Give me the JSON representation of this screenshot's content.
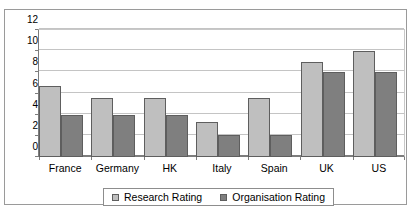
{
  "chart_data": {
    "type": "bar",
    "title": "",
    "subtitle": "",
    "xlabel": "",
    "ylabel": "",
    "categories": [
      "France",
      "Germany",
      "HK",
      "Italy",
      "Spain",
      "UK",
      "US"
    ],
    "series": [
      {
        "name": "Research Rating",
        "color": "#bfbfbf",
        "values": [
          6.7,
          5.6,
          5.6,
          3.3,
          5.6,
          9.0,
          10.0
        ]
      },
      {
        "name": "Organisation Rating",
        "color": "#7f7f7f",
        "values": [
          4.0,
          4.0,
          4.0,
          2.1,
          2.1,
          8.0,
          8.0
        ]
      }
    ],
    "ylim": [
      0,
      12
    ],
    "yticks": [
      0,
      2,
      4,
      6,
      8,
      10,
      12
    ],
    "ytick_labels": [
      "0",
      "2",
      "4",
      "6",
      "8",
      "10",
      "12"
    ],
    "grid": true,
    "grid_axis": "y",
    "legend_position": "bottom",
    "legend_entries": [
      "Research Rating",
      "Organisation Rating"
    ]
  },
  "legend": {
    "entries": [
      {
        "label": "Research Rating",
        "swatch": "series0"
      },
      {
        "label": "Organisation Rating",
        "swatch": "series1"
      }
    ]
  },
  "artifact": {
    "top_text": ""
  }
}
